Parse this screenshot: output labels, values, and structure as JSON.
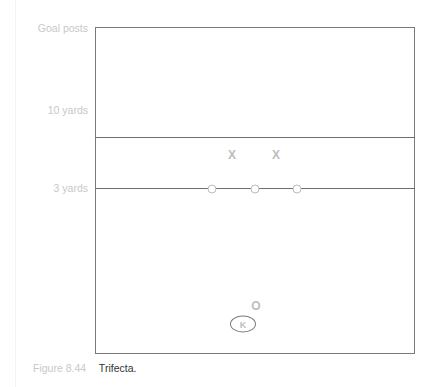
{
  "diagram": {
    "labels": {
      "goal_posts": "Goal posts",
      "ten_yards": "10 yards",
      "three_yards": "3 yards"
    },
    "players": {
      "defenders_x": [
        "X",
        "X"
      ],
      "linemen_o": [
        "O",
        "O",
        "O"
      ],
      "holder": "O",
      "kicker": "K"
    }
  },
  "caption": {
    "figure_number": "Figure 8.44",
    "title": "Trifecta."
  },
  "colors": {
    "lines": "#7a7a7a",
    "marks": "#bdbdbd",
    "label_text": "#c8c8c8",
    "caption_title": "#333333"
  }
}
